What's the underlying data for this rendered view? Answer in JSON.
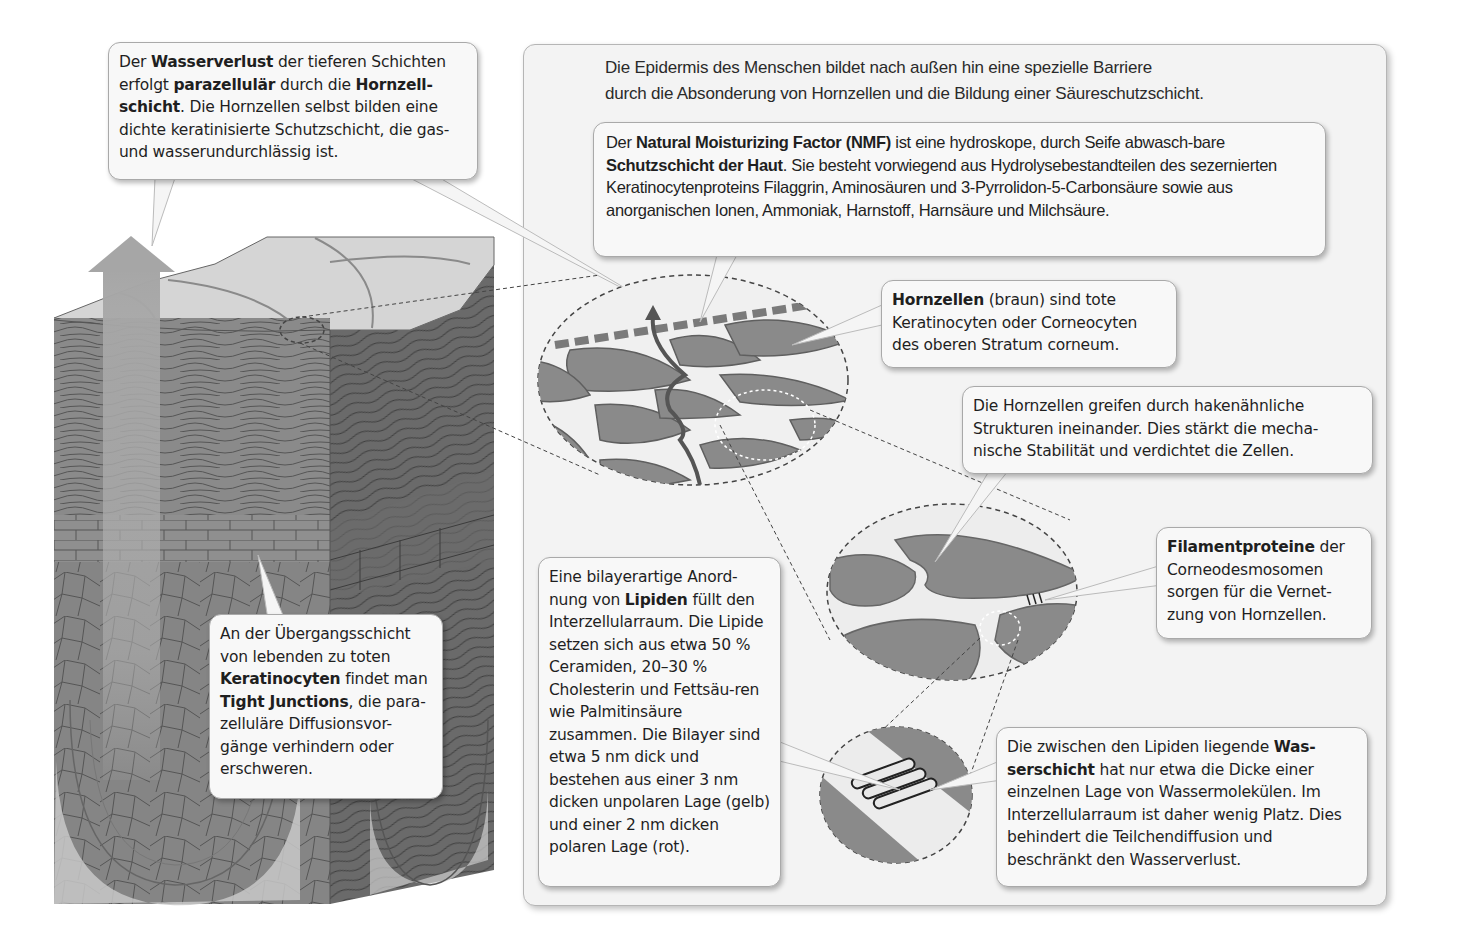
{
  "intro": {
    "line1": "Die Epidermis des Menschen bildet nach außen hin eine spezielle Barriere",
    "line2": "durch  die Absonderung von Hornzellen und die Bildung einer Säureschutzschicht."
  },
  "callouts": {
    "wasserverlust": {
      "t1": "Der ",
      "b1": "Wasserverlust",
      "t2": " der tieferen Schichten erfolgt ",
      "b2": "parazellulär",
      "t3": " durch die ",
      "b3": "Hornzell-schicht",
      "t4": ". Die Hornzellen selbst bilden eine dichte keratinisierte Schutzschicht, die gas- und wasserundurchlässig ist."
    },
    "nmf": {
      "t1": "Der ",
      "b1": "Natural Moisturizing Factor (NMF)",
      "t2": " ist eine hydroskope, durch Seife abwasch-bare ",
      "b2": "Schutzschicht der Haut",
      "t3": ". Sie besteht vorwiegend aus Hydrolysebestandteilen des sezernierten Keratinocytenproteins Filaggrin, Aminosäuren und 3-Pyrrolidon-5-Carbonsäure sowie aus anorganischen Ionen, Ammoniak, Harnstoff, Harnsäure und Milchsäure."
    },
    "hornzellen": {
      "b1": "Hornzellen",
      "t1": " (braun) sind tote Keratinocyten oder Corneocyten des oberen Stratum corneum."
    },
    "haken": {
      "t1": "Die Hornzellen greifen durch hakenähnliche Strukturen ineinander. Dies stärkt die mecha-nische Stabilität und verdichtet die Zellen."
    },
    "filament": {
      "b1": "Filamentproteine",
      "t1": " der Corneodesmosomen sorgen für die Vernet-zung von Hornzellen."
    },
    "lipide": {
      "t1": "Eine bilayerartige Anord-nung von ",
      "b1": "Lipiden",
      "t2": " füllt den Interzellularraum. Die Lipide setzen sich aus etwa 50 % Ceramiden, 20–30 % Cholesterin und Fettsäu-ren wie Palmitinsäure zusammen. Die Bilayer sind etwa 5 nm dick und bestehen aus einer 3 nm dicken unpolaren Lage (gelb) und einer 2 nm dicken polaren Lage (rot)."
    },
    "wasserschicht": {
      "t1": "Die zwischen den Lipiden liegende ",
      "b1": "Was-serschicht",
      "t2": " hat nur etwa die Dicke einer einzelnen Lage von Wassermolekülen. Im Interzellularraum ist daher wenig Platz. Dies behindert die Teilchendiffusion und beschränkt den Wasserverlust."
    },
    "tight_junctions": {
      "t1": "An der Übergangsschicht von lebenden zu toten ",
      "b1": "Keratinocyten",
      "t2": " findet man ",
      "b2": "Tight Junctions",
      "t3": ", die para-zelluläre Diffusionsvor-gänge verhindern oder erschweren."
    }
  },
  "colors": {
    "cell_fill": "#8a8a8a",
    "cell_stroke": "#5a5a5a",
    "panel_bg": "#f3f3f3",
    "callout_bg": "#f8f8f8",
    "arrow": "#a8a8a8",
    "cube_front": "#8d8d8d",
    "cube_side": "#6e6e6e",
    "cube_top": "#d6d6d6"
  }
}
